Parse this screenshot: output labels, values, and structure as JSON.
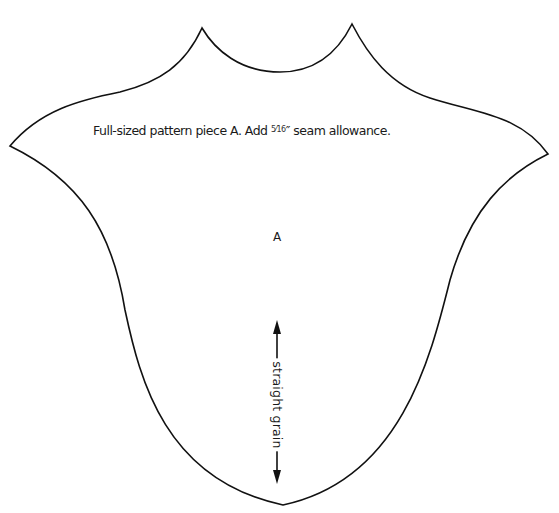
{
  "pattern": {
    "instruction": {
      "prefix": "Full-sized pattern piece A. Add ",
      "fraction": "5⁄16",
      "suffix": "″ seam allowance."
    },
    "piece_label": "A",
    "grainline_label": "straight grain"
  },
  "colors": {
    "outline": "#111111",
    "text": "#1a1a1a",
    "background": "#ffffff"
  }
}
